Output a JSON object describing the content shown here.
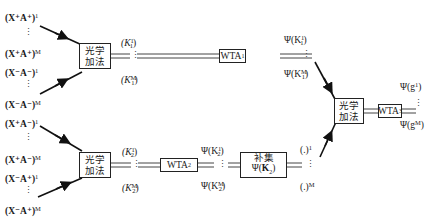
{
  "diagram": {
    "inputs_top": [
      {
        "base": "(X⁺A⁺)",
        "sup": "1"
      },
      {
        "base": "(X⁺A⁺)",
        "sup": "M"
      },
      {
        "base": "(X⁻A⁻)",
        "sup": "1"
      },
      {
        "base": "(X⁻A⁻)",
        "sup": "M"
      }
    ],
    "inputs_bottom": [
      {
        "base": "(X⁺A⁻)",
        "sup": "1"
      },
      {
        "base": "(X⁺A⁻)",
        "sup": "M"
      },
      {
        "base": "(X⁻A⁺)",
        "sup": "1"
      },
      {
        "base": "(X⁻A⁺)",
        "sup": "M"
      }
    ],
    "adder_top": {
      "line1": "光学",
      "line2": "加法"
    },
    "adder_bottom": {
      "line1": "光学",
      "line2": "加法"
    },
    "adder_final": {
      "line1": "光学",
      "line2": "加法"
    },
    "k1_labels": [
      {
        "base": "(K",
        "sub": "1",
        "sup": "1",
        "close": ")"
      },
      {
        "base": "(K",
        "sub": "1",
        "sup": "M",
        "close": ")"
      }
    ],
    "k2_labels": [
      {
        "base": "(K",
        "sub": "2",
        "sup": "1",
        "close": ")"
      },
      {
        "base": "(K",
        "sub": "2",
        "sup": "M",
        "close": ")"
      }
    ],
    "wta1": {
      "base": "WTA",
      "sub": "1"
    },
    "wta2": {
      "base": "WTA",
      "sub": "2"
    },
    "wta3": {
      "base": "WTA",
      "sub": "3"
    },
    "psi_k1": [
      {
        "base": "Ψ(K",
        "sub": "1",
        "sup": "1",
        "close": ")"
      },
      {
        "base": "Ψ(K",
        "sub": "1",
        "sup": "M",
        "close": ")"
      }
    ],
    "psi_k2": [
      {
        "base": "Ψ(K",
        "sub": "2",
        "sup": "1",
        "close": ")"
      },
      {
        "base": "Ψ(K",
        "sub": "2",
        "sup": "M",
        "close": ")"
      }
    ],
    "complement": {
      "line1": "补集",
      "line2_base": "Ψ(",
      "line2_bold": "K",
      "line2_sub": "2",
      "line2_close": ")"
    },
    "complement_out": [
      {
        "base": "(.)",
        "sup": "1"
      },
      {
        "base": "(.)",
        "sup": "M"
      }
    ],
    "outputs": [
      {
        "base": "Ψ(g",
        "sup": "1",
        "close": ")"
      },
      {
        "base": "Ψ(g",
        "sup": "M",
        "close": ")"
      }
    ],
    "ellipsis": "⋮"
  }
}
